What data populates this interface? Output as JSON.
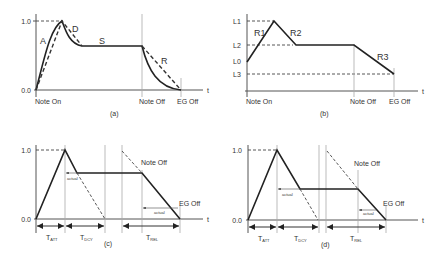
{
  "figure": {
    "panels": [
      {
        "id": "a",
        "caption": "(a)",
        "y_ticks": [
          "1.0",
          "0.0"
        ],
        "x_labels": [
          "Note On",
          "Note Off",
          "EG Off"
        ],
        "x_axis_label": "t",
        "segment_labels": [
          "A",
          "D",
          "S",
          "R"
        ]
      },
      {
        "id": "b",
        "caption": "(b)",
        "y_ticks": [
          "L1",
          "L2",
          "L0",
          "L3"
        ],
        "x_labels": [
          "Note On",
          "Note Off",
          "EG Off"
        ],
        "x_axis_label": "t",
        "segment_labels": [
          "R1",
          "R2",
          "R3"
        ]
      },
      {
        "id": "c",
        "caption": "(c)",
        "y_ticks": [
          "1.0",
          "0.0"
        ],
        "x_axis_label": "t",
        "event_labels": [
          "Note Off",
          "EG Off"
        ],
        "actual_labels": [
          "actual",
          "actual"
        ],
        "durations": [
          {
            "main": "T",
            "sub": "ATT"
          },
          {
            "main": "T",
            "sub": "DCY"
          },
          {
            "main": "T",
            "sub": "REL"
          }
        ]
      },
      {
        "id": "d",
        "caption": "(d)",
        "y_ticks": [
          "1.0",
          "0.0"
        ],
        "x_axis_label": "t",
        "event_labels": [
          "Note Off",
          "EG Off"
        ],
        "actual_labels": [
          "actual",
          "actual"
        ],
        "durations": [
          {
            "main": "T",
            "sub": "ATT"
          },
          {
            "main": "T",
            "sub": "DCY"
          },
          {
            "main": "T",
            "sub": "REL"
          }
        ]
      }
    ]
  }
}
